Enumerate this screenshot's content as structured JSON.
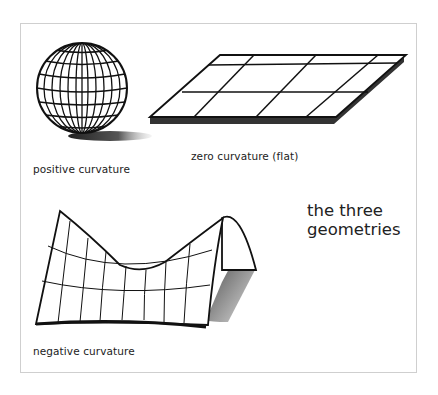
{
  "figure": {
    "title_line1": "the three",
    "title_line2": "geometries",
    "panels": [
      {
        "id": "sphere",
        "label": "positive curvature"
      },
      {
        "id": "plane",
        "label": "zero curvature (flat)"
      },
      {
        "id": "saddle",
        "label": "negative curvature"
      }
    ]
  }
}
